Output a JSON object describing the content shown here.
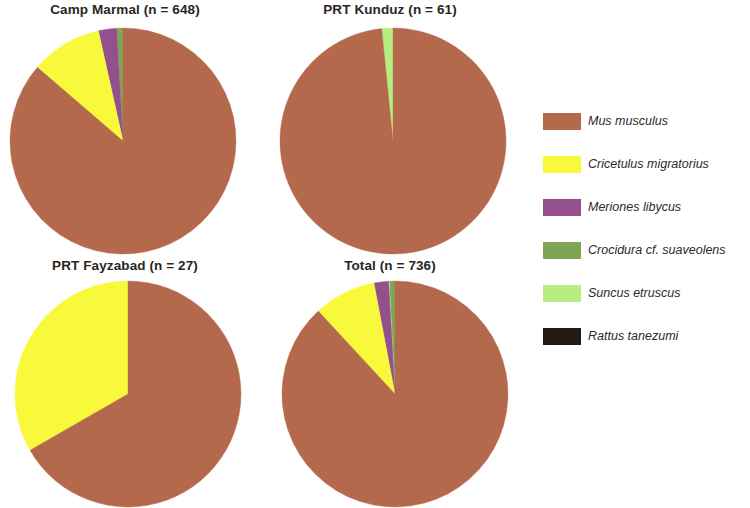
{
  "figure": {
    "background_color": "#ffffff",
    "text_color": "#231f20"
  },
  "legend": {
    "position": "right",
    "items": [
      {
        "label": "Mus musculus",
        "color": "#b4694c",
        "key": "mus-musculus"
      },
      {
        "label": "Cricetulus migratorius",
        "color": "#f9f93c",
        "key": "cricetulus-migratorius"
      },
      {
        "label": "Meriones libycus",
        "color": "#93508c",
        "key": "meriones-libycus"
      },
      {
        "label": "Crocidura cf. suaveolens",
        "color": "#7ea554",
        "key": "crocidura-cf-suaveolens"
      },
      {
        "label": "Suncus etruscus",
        "color": "#b6ef80",
        "key": "suncus-etruscus"
      },
      {
        "label": "Rattus tanezumi",
        "color": "#231a14",
        "key": "rattus-tanezumi"
      }
    ]
  },
  "panels": [
    {
      "id": "camp-marmal",
      "title": "Camp Marmal (n = 648)",
      "n": 648
    },
    {
      "id": "prt-kunduz",
      "title": "PRT Kunduz (n = 61)",
      "n": 61
    },
    {
      "id": "prt-fayzabad",
      "title": "PRT Fayzabad (n = 27)",
      "n": 27
    },
    {
      "id": "total",
      "title": "Total (n = 736)",
      "n": 736
    }
  ],
  "chart_data": {
    "type": "pie",
    "title": "",
    "legend_position": "right",
    "categories": [
      "Mus musculus",
      "Cricetulus migratorius",
      "Meriones libycus",
      "Crocidura cf. suaveolens",
      "Suncus etruscus",
      "Rattus tanezumi"
    ],
    "colors": [
      "#b4694c",
      "#f9f93c",
      "#93508c",
      "#7ea554",
      "#b6ef80",
      "#231a14"
    ],
    "start_angle_deg": 0,
    "direction": "clockwise",
    "charts": [
      {
        "name": "Camp Marmal",
        "title": "Camp Marmal (n = 648)",
        "n": 648,
        "values": [
          86.3,
          10.2,
          2.6,
          0.9,
          0.0,
          0.0
        ],
        "unit": "percent"
      },
      {
        "name": "PRT Kunduz",
        "title": "PRT Kunduz (n = 61)",
        "n": 61,
        "values": [
          98.4,
          0.0,
          0.0,
          0.0,
          1.6,
          0.0
        ],
        "unit": "percent"
      },
      {
        "name": "PRT Fayzabad",
        "title": "PRT Fayzabad (n = 27)",
        "n": 27,
        "values": [
          66.7,
          33.3,
          0.0,
          0.0,
          0.0,
          0.0
        ],
        "unit": "percent"
      },
      {
        "name": "Total",
        "title": "Total (n = 736)",
        "n": 736,
        "values": [
          88.2,
          8.9,
          2.1,
          0.8,
          0.1,
          0.0
        ],
        "unit": "percent"
      }
    ]
  }
}
